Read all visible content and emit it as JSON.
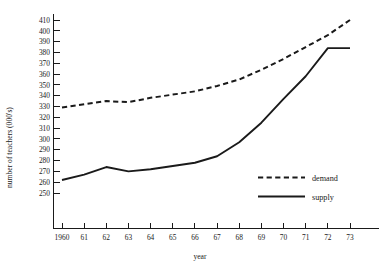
{
  "chart_data": {
    "type": "line",
    "title": "",
    "xlabel": "year",
    "ylabel": "number of teachers  (000's)",
    "x": [
      1960,
      1961,
      1962,
      1963,
      1964,
      1965,
      1966,
      1967,
      1968,
      1969,
      1970,
      1971,
      1972,
      1973
    ],
    "xtick_labels": [
      "1960",
      "61",
      "62",
      "63",
      "64",
      "65",
      "66",
      "67",
      "68",
      "69",
      "70",
      "71",
      "72",
      "73"
    ],
    "ytick_labels": [
      "250",
      "260",
      "270",
      "280",
      "290",
      "300",
      "310",
      "320",
      "330",
      "340",
      "350",
      "360",
      "370",
      "380",
      "390",
      "400",
      "410"
    ],
    "ytick_values": [
      250,
      260,
      270,
      280,
      290,
      300,
      310,
      320,
      330,
      340,
      350,
      360,
      370,
      380,
      390,
      400,
      410
    ],
    "ylim": [
      243,
      414
    ],
    "xlim": [
      1959.2,
      1974.0
    ],
    "grid": false,
    "legend_position": "middle-right",
    "series": [
      {
        "name": "demand",
        "style": "dashed",
        "values": [
          329,
          332,
          335,
          334,
          338,
          341,
          344,
          349,
          355,
          364,
          374,
          385,
          396,
          410
        ]
      },
      {
        "name": "supply",
        "style": "solid",
        "values": [
          262,
          267,
          274,
          270,
          272,
          275,
          278,
          284,
          297,
          315,
          337,
          358,
          384,
          384
        ]
      }
    ]
  },
  "legend": {
    "items": [
      {
        "label": "demand"
      },
      {
        "label": "supply"
      }
    ]
  },
  "colors": {
    "ink": "#1a1a1a",
    "background": "#ffffff"
  }
}
